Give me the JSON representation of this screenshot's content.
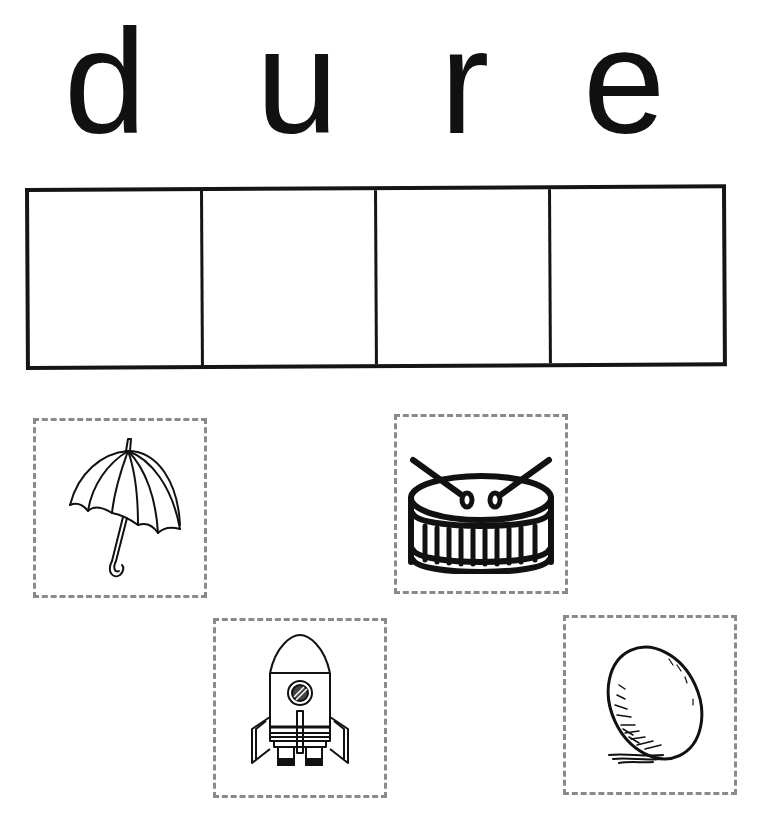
{
  "worksheet": {
    "letters": [
      {
        "char": "d",
        "name": "letter-d"
      },
      {
        "char": "u",
        "name": "letter-u"
      },
      {
        "char": "r",
        "name": "letter-r"
      },
      {
        "char": "e",
        "name": "letter-e"
      }
    ],
    "answer_boxes": 4,
    "picture_cards": [
      {
        "label": "umbrella",
        "icon": "umbrella-icon"
      },
      {
        "label": "drum",
        "icon": "drum-icon"
      },
      {
        "label": "rocket",
        "icon": "rocket-icon"
      },
      {
        "label": "egg",
        "icon": "egg-icon"
      }
    ]
  },
  "colors": {
    "ink": "#111111",
    "dashed_border": "#8a8a8a",
    "background": "#ffffff"
  }
}
